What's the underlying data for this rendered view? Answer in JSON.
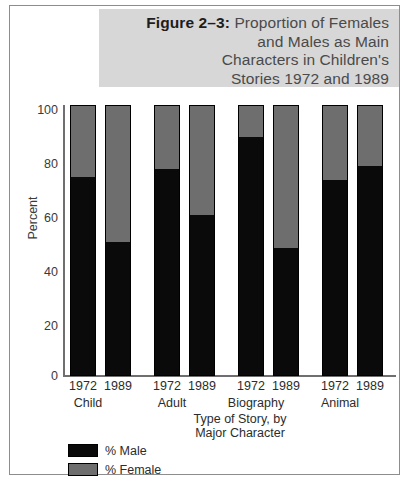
{
  "figure": {
    "title_lines": [
      {
        "strong": "Figure 2–3:",
        "rest": " Proportion of Females"
      },
      {
        "strong": "",
        "rest": "and Males as Main"
      },
      {
        "strong": "",
        "rest": "Characters in Children's"
      },
      {
        "strong": "",
        "rest": "Stories 1972 and 1989"
      }
    ],
    "title_l1_strong": "Figure 2–3:",
    "title_l1_rest": "Proportion of Females",
    "title_l2": "and Males as Main",
    "title_l3": "Characters in Children's",
    "title_l4": "Stories 1972 and 1989"
  },
  "colors": {
    "male": "#0a0a0a",
    "female": "#6e6e6e",
    "title_band": "#d7d7d7",
    "frame": "#8d8d8d"
  },
  "chart_data": {
    "type": "bar",
    "subtype": "stacked-100-percent",
    "title": "Figure 2–3: Proportion of Females and Males as Main Characters in Children's Stories 1972 and 1989",
    "xlabel_line1": "Type of Story, by",
    "xlabel_line2": "Major Character",
    "ylabel": "Percent",
    "ylim": [
      0,
      100
    ],
    "yticks": [
      0,
      20,
      40,
      60,
      80,
      100
    ],
    "ytick_labels": [
      "0",
      "20",
      "40",
      "60",
      "80",
      "100"
    ],
    "grid": false,
    "legend_position": "bottom-left",
    "groups": [
      "Child",
      "Adult",
      "Biography",
      "Animal"
    ],
    "years": [
      "1972",
      "1989"
    ],
    "categories": [
      "Child 1972",
      "Child 1989",
      "Adult 1972",
      "Adult 1989",
      "Biography 1972",
      "Biography 1989",
      "Animal 1972",
      "Animal 1989"
    ],
    "series": [
      {
        "name": "% Male",
        "color": "#0a0a0a",
        "values": [
          73,
          49,
          76,
          59,
          88,
          47,
          72,
          77
        ]
      },
      {
        "name": "% Female",
        "color": "#6e6e6e",
        "values": [
          27,
          51,
          24,
          41,
          12,
          53,
          28,
          23
        ]
      }
    ],
    "legend": [
      "% Male",
      "% Female"
    ]
  },
  "bars": [
    {
      "label": "1972",
      "group": "Child",
      "male": 73,
      "x": 60
    },
    {
      "label": "1989",
      "group": "Child",
      "male": 49,
      "x": 95
    },
    {
      "label": "1972",
      "group": "Adult",
      "male": 76,
      "x": 144
    },
    {
      "label": "1989",
      "group": "Adult",
      "male": 59,
      "x": 179
    },
    {
      "label": "1972",
      "group": "Biography",
      "male": 88,
      "x": 228
    },
    {
      "label": "1989",
      "group": "Biography",
      "male": 47,
      "x": 263
    },
    {
      "label": "1972",
      "group": "Animal",
      "male": 72,
      "x": 312
    },
    {
      "label": "1989",
      "group": "Animal",
      "male": 77,
      "x": 347
    }
  ],
  "groups_layout": [
    {
      "name": "Child",
      "x": 33
    },
    {
      "name": "Adult",
      "x": 117
    },
    {
      "name": "Biography",
      "x": 201
    },
    {
      "name": "Animal",
      "x": 285
    }
  ],
  "yticks_layout": [
    {
      "label": "100",
      "y": 98
    },
    {
      "label": "80",
      "y": 152
    },
    {
      "label": "60",
      "y": 206
    },
    {
      "label": "40",
      "y": 260
    },
    {
      "label": "20",
      "y": 314
    },
    {
      "label": "0",
      "y": 364
    }
  ],
  "legend_rows": [
    {
      "label": "% Male",
      "color": "#0a0a0a"
    },
    {
      "label": "% Female",
      "color": "#6e6e6e"
    }
  ]
}
